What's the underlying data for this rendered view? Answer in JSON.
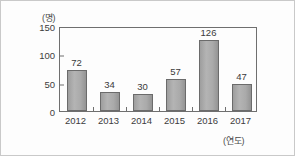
{
  "chart_data": {
    "type": "bar",
    "title": "",
    "subtitle": "",
    "xlabel": "(연도)",
    "ylabel": "(명)",
    "categories": [
      "2012",
      "2013",
      "2014",
      "2015",
      "2016",
      "2017"
    ],
    "values": [
      72,
      34,
      30,
      57,
      126,
      47
    ],
    "series": [
      {
        "name": "",
        "values": [
          72,
          34,
          30,
          57,
          126,
          47
        ]
      }
    ],
    "ylim": [
      0,
      150
    ],
    "yticks": [
      0,
      50,
      100,
      150
    ],
    "ytick_labels": [
      "0",
      "50",
      "100",
      "150"
    ],
    "grid": false,
    "legend": false,
    "legend_position": "none",
    "data_labels": [
      "72",
      "34",
      "30",
      "57",
      "126",
      "47"
    ],
    "bar_color": "#aaaaaa",
    "bar_edge_color": "#6b6b6b",
    "axis_color": "#6f6f6f",
    "background_color": "#fdfdfd",
    "frame_color": "#c9c9c9"
  }
}
